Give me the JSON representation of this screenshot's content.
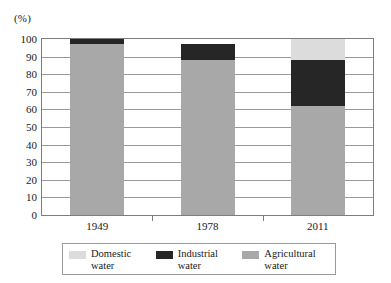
{
  "chart_data": {
    "type": "bar",
    "stacked": true,
    "title": "",
    "subtitle": "",
    "xlabel": "",
    "ylabel": "(%)",
    "unit_label": "(%)",
    "categories": [
      "1949",
      "1978",
      "2011"
    ],
    "ylim": [
      0,
      100
    ],
    "ytick_step": 10,
    "yticks": [
      "100",
      "90",
      "80",
      "70",
      "60",
      "50",
      "40",
      "30",
      "20",
      "10",
      "0"
    ],
    "grid": true,
    "legend_position": "bottom",
    "series": [
      {
        "name": "Domestic\nwater",
        "key": "domestic",
        "color": "#dcdcdc",
        "values": [
          0,
          0,
          12
        ]
      },
      {
        "name": "Industrial\nwater",
        "key": "industrial",
        "color": "#262626",
        "values": [
          3,
          9,
          26
        ]
      },
      {
        "name": "Agricultural\nwater",
        "key": "agricultural",
        "color": "#a8a8a8",
        "values": [
          97,
          88,
          62
        ]
      }
    ]
  },
  "axis": {
    "unit": "(%)",
    "y_labels": [
      "100",
      "90",
      "80",
      "70",
      "60",
      "50",
      "40",
      "30",
      "20",
      "10",
      "0"
    ],
    "x_labels": [
      "1949",
      "1978",
      "2011"
    ]
  },
  "legend": {
    "items": [
      {
        "label": "Domestic\nwater",
        "color": "#dcdcdc"
      },
      {
        "label": "Industrial\nwater",
        "color": "#262626"
      },
      {
        "label": "Agricultural\nwater",
        "color": "#a8a8a8"
      }
    ]
  }
}
